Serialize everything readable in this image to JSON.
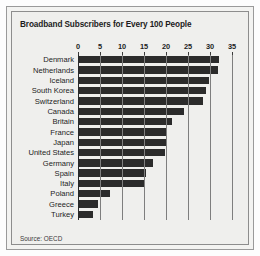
{
  "chart_data": {
    "type": "bar",
    "orientation": "horizontal",
    "title": "Broadband Subscribers for Every 100 People",
    "xlabel": "",
    "ylabel": "",
    "xlim": [
      0,
      35
    ],
    "ticks": [
      0,
      5,
      10,
      15,
      20,
      25,
      30,
      35
    ],
    "grid": true,
    "legend": null,
    "source": "Source: OECD",
    "bar_color": "#2b2b2b",
    "panel_color": "#efefed",
    "categories": [
      "Denmark",
      "Netherlands",
      "Iceland",
      "South Korea",
      "Switzerland",
      "Canada",
      "Britain",
      "France",
      "Japan",
      "United States",
      "Germany",
      "Spain",
      "Italy",
      "Poland",
      "Greece",
      "Turkey"
    ],
    "values": [
      32.0,
      31.9,
      29.7,
      29.0,
      28.5,
      24.0,
      21.3,
      20.1,
      20.0,
      19.8,
      17.0,
      15.4,
      15.2,
      7.2,
      4.6,
      3.5
    ]
  },
  "notes": {
    "source_label": "Source: OECD"
  }
}
